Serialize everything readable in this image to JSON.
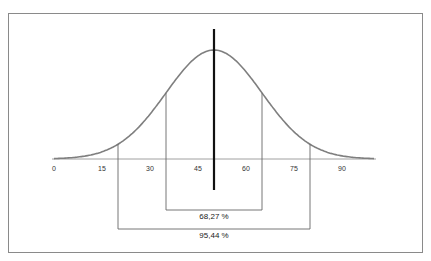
{
  "chart_data": {
    "type": "line",
    "title": "",
    "xlabel": "",
    "ylabel": "",
    "x_ticks": [
      "0",
      "15",
      "30",
      "45",
      "60",
      "75",
      "90"
    ],
    "xlim": [
      0,
      100
    ],
    "mean": 50,
    "std_dev": 15,
    "series": [
      {
        "name": "normal-curve",
        "color": "#7f7f7f"
      }
    ],
    "intervals": [
      {
        "from": 35,
        "to": 65,
        "label": "68,27 %"
      },
      {
        "from": 20,
        "to": 80,
        "label": "95,44 %"
      }
    ],
    "grid": false,
    "legend": "none"
  }
}
